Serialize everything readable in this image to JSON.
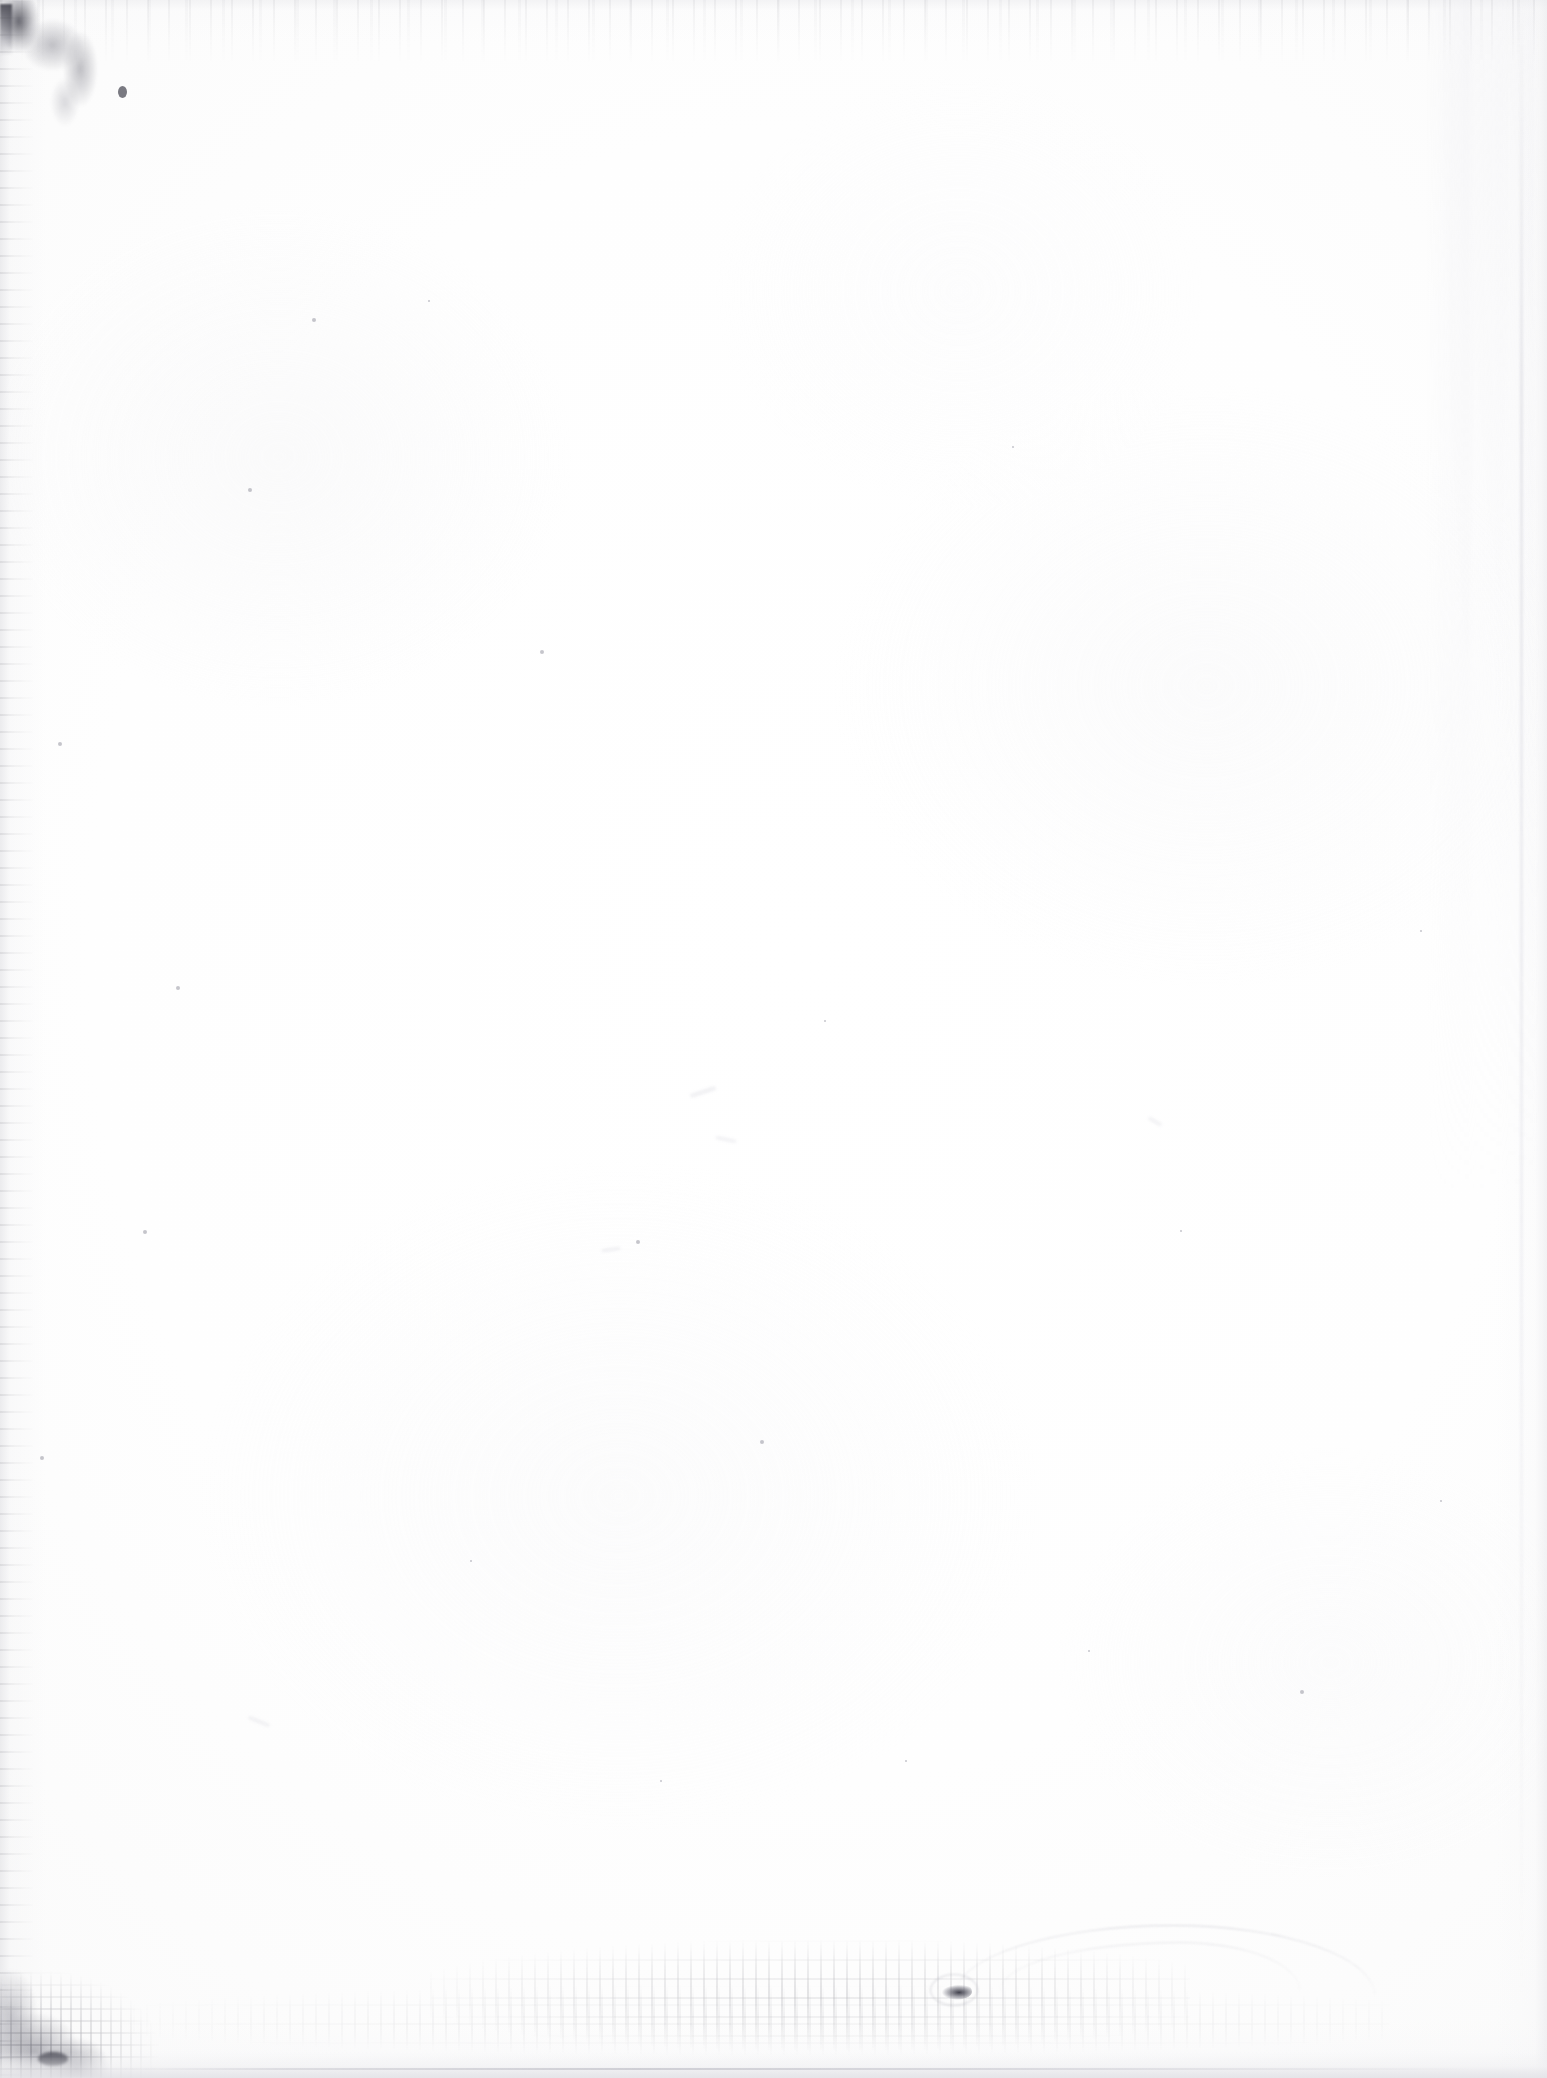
{
  "page": {
    "kind": "scanned-blank-page",
    "width_px": 1547,
    "height_px": 2078,
    "paper_color": "#fdfdfd",
    "background_color": "#ffffff",
    "text_content": "",
    "visible_text": []
  },
  "artifacts": {
    "label": "scan artifacts",
    "items": [
      {
        "name": "top-left-corner-smudge",
        "color": "#46465a"
      },
      {
        "name": "top-edge-speckle-band",
        "color": "#82828a"
      },
      {
        "name": "left-edge-speckle-strip",
        "color": "#787880"
      },
      {
        "name": "right-edge-scan-streaks",
        "color": "#ececf0"
      },
      {
        "name": "bottom-left-corner-grain",
        "color": "#5a5a6c"
      },
      {
        "name": "bottom-center-toner-speckle",
        "color": "#5f5f69"
      },
      {
        "name": "bottom-right-hook-smudge",
        "color": "#2d2d3a"
      },
      {
        "name": "bottom-right-arc-line",
        "color": "#a8a8b4"
      },
      {
        "name": "bottom-edge-gray-band",
        "color": "#e4e4e8"
      }
    ]
  },
  "specks": [
    {
      "x": 312,
      "y": 318,
      "r": 2
    },
    {
      "x": 248,
      "y": 488,
      "r": 2
    },
    {
      "x": 428,
      "y": 300,
      "r": 1
    },
    {
      "x": 540,
      "y": 650,
      "r": 2
    },
    {
      "x": 636,
      "y": 1240,
      "r": 2
    },
    {
      "x": 824,
      "y": 1020,
      "r": 1
    },
    {
      "x": 1012,
      "y": 446,
      "r": 1
    },
    {
      "x": 760,
      "y": 1440,
      "r": 2
    },
    {
      "x": 1088,
      "y": 1650,
      "r": 1
    },
    {
      "x": 1300,
      "y": 1690,
      "r": 2
    },
    {
      "x": 176,
      "y": 986,
      "r": 2
    },
    {
      "x": 143,
      "y": 1230,
      "r": 2
    },
    {
      "x": 660,
      "y": 1780,
      "r": 1
    },
    {
      "x": 905,
      "y": 1760,
      "r": 1
    },
    {
      "x": 1180,
      "y": 1230,
      "r": 1
    },
    {
      "x": 470,
      "y": 1560,
      "r": 1
    },
    {
      "x": 1420,
      "y": 930,
      "r": 1
    },
    {
      "x": 58,
      "y": 742,
      "r": 2
    },
    {
      "x": 40,
      "y": 1456,
      "r": 2
    },
    {
      "x": 1440,
      "y": 1500,
      "r": 1
    }
  ],
  "wisps": [
    {
      "x": 690,
      "y": 1090,
      "w": 26,
      "h": 4,
      "rot": -18
    },
    {
      "x": 716,
      "y": 1138,
      "w": 20,
      "h": 3,
      "rot": 12
    },
    {
      "x": 1148,
      "y": 1120,
      "w": 14,
      "h": 3,
      "rot": 30
    },
    {
      "x": 602,
      "y": 1248,
      "w": 18,
      "h": 3,
      "rot": -8
    },
    {
      "x": 248,
      "y": 1720,
      "w": 22,
      "h": 3,
      "rot": 22
    }
  ]
}
